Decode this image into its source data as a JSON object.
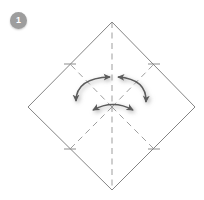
{
  "figure": {
    "step_badge": {
      "label": "1",
      "color": "#9d9d9d",
      "text_color": "#ffffff"
    },
    "canvas": {
      "width": 204,
      "height": 200,
      "background": "#ffffff"
    },
    "colors": {
      "paper_outline": "#6e6e6e",
      "crease_dashed": "#8d8d8d",
      "arrow": "#5b5b5b",
      "arrow_shadow": "#b9b9b9"
    },
    "shape": {
      "name": "square-rotated-45",
      "vertices": [
        {
          "name": "top",
          "x": 112,
          "y": 22
        },
        {
          "name": "right",
          "x": 195,
          "y": 107
        },
        {
          "name": "bottom",
          "x": 112,
          "y": 190
        },
        {
          "name": "left",
          "x": 28,
          "y": 107
        }
      ]
    },
    "creases": [
      {
        "name": "vertical-center-crease",
        "style": "dashed",
        "x1": 112,
        "y1": 22,
        "x2": 112,
        "y2": 190
      },
      {
        "name": "crease-upper-left",
        "style": "dashed",
        "x1": 112,
        "y1": 107,
        "x2": 70,
        "y2": 64
      },
      {
        "name": "crease-upper-right",
        "style": "dashed",
        "x1": 112,
        "y1": 107,
        "x2": 154,
        "y2": 64
      },
      {
        "name": "crease-lower-left",
        "style": "dashed",
        "x1": 112,
        "y1": 107,
        "x2": 70,
        "y2": 149
      },
      {
        "name": "crease-lower-right",
        "style": "dashed",
        "x1": 112,
        "y1": 107,
        "x2": 154,
        "y2": 149
      }
    ],
    "edge_ticks": [
      {
        "name": "tick-upper-left",
        "x": 70,
        "y": 64
      },
      {
        "name": "tick-upper-right",
        "x": 154,
        "y": 64
      },
      {
        "name": "tick-lower-left",
        "x": 70,
        "y": 149
      },
      {
        "name": "tick-lower-right",
        "x": 154,
        "y": 149
      }
    ],
    "arrows": [
      {
        "name": "fold-arrow-left",
        "type": "double-headed-curved",
        "from": {
          "x": 76,
          "y": 101
        },
        "to": {
          "x": 110,
          "y": 77
        },
        "bow": "outward-left"
      },
      {
        "name": "fold-arrow-right",
        "type": "double-headed-curved",
        "from": {
          "x": 118,
          "y": 77
        },
        "to": {
          "x": 146,
          "y": 102
        },
        "bow": "outward-right"
      },
      {
        "name": "fold-arrow-bottom",
        "type": "double-headed-curved",
        "from": {
          "x": 93,
          "y": 110
        },
        "to": {
          "x": 133,
          "y": 110
        },
        "bow": "upward"
      }
    ]
  }
}
